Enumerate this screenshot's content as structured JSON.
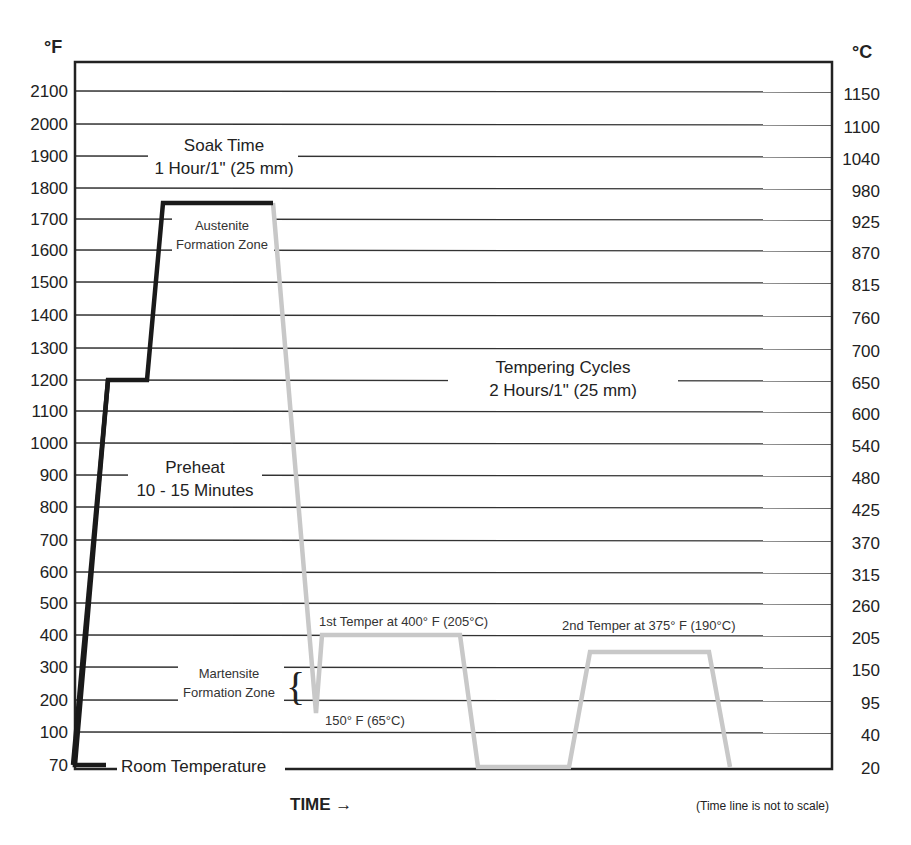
{
  "chart_data": {
    "type": "line",
    "left_axis_unit": "°F",
    "right_axis_unit": "°C",
    "left_ticks": [
      "2100",
      "2000",
      "1900",
      "1800",
      "1700",
      "1600",
      "1500",
      "1400",
      "1300",
      "1200",
      "1100",
      "1000",
      "900",
      "800",
      "700",
      "600",
      "500",
      "400",
      "300",
      "200",
      "100",
      "70"
    ],
    "right_ticks": [
      "1150",
      "1100",
      "1040",
      "980",
      "925",
      "870",
      "815",
      "760",
      "700",
      "650",
      "600",
      "540",
      "480",
      "425",
      "370",
      "315",
      "260",
      "205",
      "150",
      "95",
      "40",
      "20"
    ],
    "xlabel": "TIME →",
    "x_note": "(Time line is not to scale)",
    "ylim_f": [
      70,
      2100
    ],
    "grid": true,
    "series": [
      {
        "name": "Heating (preheat + austenitize)",
        "color": "#1a1a1a",
        "points_f": [
          [
            0,
            70
          ],
          [
            1,
            1200
          ],
          [
            2,
            1200
          ],
          [
            3,
            1750
          ],
          [
            4,
            1750
          ]
        ]
      },
      {
        "name": "Quench + tempering cycles",
        "color": "#c8c8c8",
        "points_f": [
          [
            4,
            1750
          ],
          [
            5,
            150
          ],
          [
            5.3,
            400
          ],
          [
            6,
            400
          ],
          [
            6.3,
            70
          ],
          [
            7,
            70
          ],
          [
            7.3,
            375
          ],
          [
            8,
            375
          ],
          [
            8.3,
            70
          ]
        ]
      }
    ],
    "annotations": {
      "soak_title": "Soak Time",
      "soak_sub": "1 Hour/1\" (25 mm)",
      "austenite_1": "Austenite",
      "austenite_2": "Formation Zone",
      "tempering_title": "Tempering Cycles",
      "tempering_sub": "2 Hours/1\" (25 mm)",
      "preheat_title": "Preheat",
      "preheat_sub": "10 - 15 Minutes",
      "temper1": "1st Temper at 400° F (205°C)",
      "temper2": "2nd Temper at 375° F (190°C)",
      "martensite_1": "Martensite",
      "martensite_2": "Formation Zone",
      "quench_low": "150° F (65°C)",
      "room_temp": "Room Temperature"
    }
  }
}
